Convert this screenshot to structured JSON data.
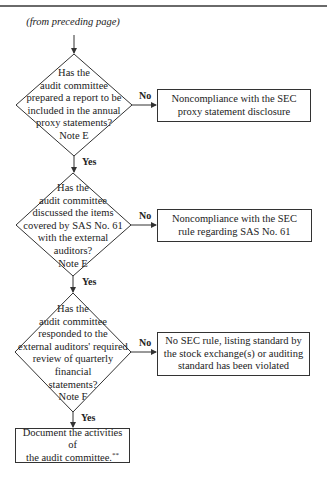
{
  "caption": "(from preceding page)",
  "decisions": [
    {
      "lines": [
        "Has the",
        "audit committee",
        "prepared a report to be",
        "included in the annual",
        "proxy statements?",
        "Note E"
      ],
      "yes_label": "Yes",
      "no_label": "No",
      "no_outcome": {
        "lines": [
          "Noncompliance with the SEC",
          "proxy statement disclosure"
        ]
      }
    },
    {
      "lines": [
        "Has the",
        "audit committee",
        "discussed the items",
        "covered by SAS No. 61",
        "with the external",
        "auditors?",
        "Note E"
      ],
      "yes_label": "Yes",
      "no_label": "No",
      "no_outcome": {
        "lines": [
          "Noncompliance with the SEC",
          "rule regarding SAS No. 61"
        ]
      }
    },
    {
      "lines": [
        "Has the",
        "audit committee",
        "responded to the",
        "external auditors' required",
        "review of quarterly",
        "financial",
        "statements?",
        "Note F"
      ],
      "yes_label": "Yes",
      "no_label": "No",
      "no_outcome": {
        "lines": [
          "No SEC rule, listing standard by",
          "the stock exchange(s) or auditing",
          "standard has been violated"
        ]
      }
    }
  ],
  "final_step": {
    "lines": [
      "Document the activities of",
      "the audit committee."
    ],
    "footnote_mark": "**"
  },
  "colors": {
    "line": "#333333",
    "rule": "#6a6a6a"
  }
}
